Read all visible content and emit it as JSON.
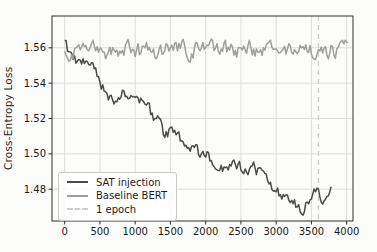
{
  "figure": {
    "background": "#fcfcfb"
  },
  "chart_data": {
    "type": "line",
    "title": "",
    "xlabel": "",
    "ylabel": "Cross-Entropy Loss",
    "xlim": [
      -180,
      4090
    ],
    "ylim": [
      1.462,
      1.578
    ],
    "x_ticks": [
      0,
      500,
      1000,
      1500,
      2000,
      2500,
      3000,
      3500,
      4000
    ],
    "x_tick_labels": [
      "0",
      "500",
      "1000",
      "1500",
      "2000",
      "2500",
      "3000",
      "3500",
      "4000"
    ],
    "y_ticks": [
      1.48,
      1.5,
      1.52,
      1.54,
      1.56
    ],
    "y_tick_labels": [
      "1.48",
      "1.50",
      "1.52",
      "1.54",
      "1.56"
    ],
    "grid": true,
    "grid_color": "#dcdcdc",
    "axis_color": "#2e2e2e",
    "tick_label_color": "#1a1a1a",
    "legend_position": "lower left",
    "series": [
      {
        "name": "SAT injection",
        "color": "#4b4b4b",
        "x_start": 0,
        "x_end": 3780,
        "step": 20,
        "noise_amplitude": 0.0032,
        "noise_persistence": 0.5,
        "seed": 9,
        "trend": [
          [
            0,
            1.566
          ],
          [
            60,
            1.5565
          ],
          [
            150,
            1.5525
          ],
          [
            250,
            1.5515
          ],
          [
            350,
            1.5505
          ],
          [
            450,
            1.545
          ],
          [
            550,
            1.5375
          ],
          [
            650,
            1.5315
          ],
          [
            750,
            1.5315
          ],
          [
            850,
            1.534
          ],
          [
            950,
            1.531
          ],
          [
            1050,
            1.531
          ],
          [
            1150,
            1.5265
          ],
          [
            1250,
            1.5215
          ],
          [
            1350,
            1.5165
          ],
          [
            1420,
            1.508
          ],
          [
            1500,
            1.5125
          ],
          [
            1600,
            1.5105
          ],
          [
            1700,
            1.5055
          ],
          [
            1800,
            1.5035
          ],
          [
            1900,
            1.5005
          ],
          [
            2000,
            1.5005
          ],
          [
            2100,
            1.497
          ],
          [
            2200,
            1.494
          ],
          [
            2300,
            1.4895
          ],
          [
            2400,
            1.4925
          ],
          [
            2500,
            1.4915
          ],
          [
            2600,
            1.4885
          ],
          [
            2700,
            1.4935
          ],
          [
            2800,
            1.4865
          ],
          [
            2900,
            1.4825
          ],
          [
            3000,
            1.4785
          ],
          [
            3100,
            1.477
          ],
          [
            3200,
            1.4745
          ],
          [
            3300,
            1.4705
          ],
          [
            3400,
            1.469
          ],
          [
            3500,
            1.4765
          ],
          [
            3600,
            1.4775
          ],
          [
            3700,
            1.4735
          ],
          [
            3780,
            1.479
          ]
        ]
      },
      {
        "name": "Baseline BERT",
        "color": "#9e9e9e",
        "x_start": 0,
        "x_end": 4020,
        "step": 20,
        "noise_amplitude": 0.0042,
        "noise_persistence": 0.55,
        "seed": 4,
        "trend": [
          [
            0,
            1.5545
          ],
          [
            100,
            1.5585
          ],
          [
            400,
            1.5575
          ],
          [
            800,
            1.5595
          ],
          [
            1200,
            1.5575
          ],
          [
            1600,
            1.5585
          ],
          [
            2000,
            1.559
          ],
          [
            2400,
            1.5585
          ],
          [
            2800,
            1.5585
          ],
          [
            3200,
            1.558
          ],
          [
            3600,
            1.5595
          ],
          [
            4020,
            1.5575
          ]
        ]
      }
    ],
    "vline": {
      "x": 3600,
      "label": "1 epoch",
      "color": "#cdcdcd",
      "style": "dashed"
    }
  }
}
